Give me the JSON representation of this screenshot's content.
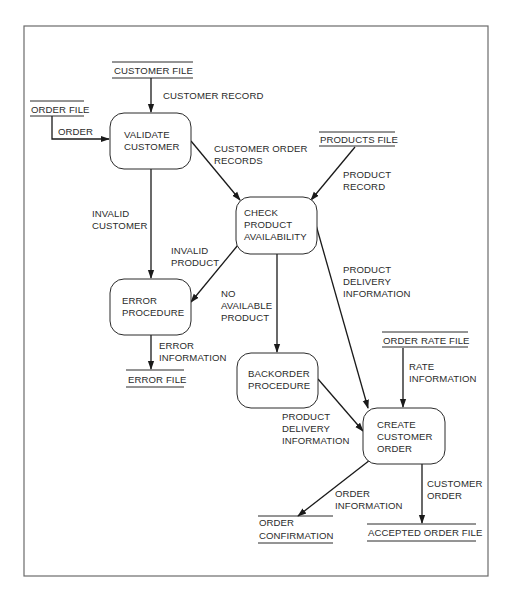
{
  "diagram": {
    "type": "data-flow-diagram",
    "processes": [
      {
        "id": "validate",
        "lines": [
          "VALIDATE",
          "CUSTOMER"
        ]
      },
      {
        "id": "check",
        "lines": [
          "CHECK",
          "PRODUCT",
          "AVAILABILITY"
        ]
      },
      {
        "id": "error",
        "lines": [
          "ERROR",
          "PROCEDURE"
        ]
      },
      {
        "id": "backorder",
        "lines": [
          "BACKORDER",
          "PROCEDURE"
        ]
      },
      {
        "id": "create",
        "lines": [
          "CREATE",
          "CUSTOMER",
          "ORDER"
        ]
      }
    ],
    "stores": [
      {
        "id": "customer_file",
        "lines": [
          "CUSTOMER FILE"
        ]
      },
      {
        "id": "order_file",
        "lines": [
          "ORDER FILE"
        ]
      },
      {
        "id": "products_file",
        "lines": [
          "PRODUCTS FILE"
        ]
      },
      {
        "id": "error_file",
        "lines": [
          "ERROR FILE"
        ]
      },
      {
        "id": "order_rate_file",
        "lines": [
          "ORDER RATE FILE"
        ]
      },
      {
        "id": "order_confirmation",
        "lines": [
          "ORDER",
          "CONFIRMATION"
        ]
      },
      {
        "id": "accepted_order_file",
        "lines": [
          "ACCEPTED ORDER FILE"
        ]
      }
    ],
    "flows": [
      {
        "id": "customer_record",
        "from": "customer_file",
        "to": "validate",
        "lines": [
          "CUSTOMER RECORD"
        ]
      },
      {
        "id": "order",
        "from": "order_file",
        "to": "validate",
        "lines": [
          "ORDER"
        ]
      },
      {
        "id": "customer_order_records",
        "from": "validate",
        "to": "check",
        "lines": [
          "CUSTOMER ORDER",
          "RECORDS"
        ]
      },
      {
        "id": "product_record",
        "from": "products_file",
        "to": "check",
        "lines": [
          "PRODUCT",
          "RECORD"
        ]
      },
      {
        "id": "invalid_customer",
        "from": "validate",
        "to": "error",
        "lines": [
          "INVALID",
          "CUSTOMER"
        ]
      },
      {
        "id": "invalid_product",
        "from": "check",
        "to": "error",
        "lines": [
          "INVALID",
          "PRODUCT"
        ]
      },
      {
        "id": "no_available_product",
        "from": "check",
        "to": "backorder",
        "lines": [
          "NO",
          "AVAILABLE",
          "PRODUCT"
        ]
      },
      {
        "id": "product_delivery_info_1",
        "from": "check",
        "to": "create",
        "lines": [
          "PRODUCT",
          "DELIVERY",
          "INFORMATION"
        ]
      },
      {
        "id": "error_information",
        "from": "error",
        "to": "error_file",
        "lines": [
          "ERROR",
          "INFORMATION"
        ]
      },
      {
        "id": "rate_information",
        "from": "order_rate_file",
        "to": "create",
        "lines": [
          "RATE",
          "INFORMATION"
        ]
      },
      {
        "id": "product_delivery_info_2",
        "from": "backorder",
        "to": "create",
        "lines": [
          "PRODUCT",
          "DELIVERY",
          "INFORMATION"
        ]
      },
      {
        "id": "order_information",
        "from": "create",
        "to": "order_confirmation",
        "lines": [
          "ORDER",
          "INFORMATION"
        ]
      },
      {
        "id": "customer_order",
        "from": "create",
        "to": "accepted_order_file",
        "lines": [
          "CUSTOMER",
          "ORDER"
        ]
      }
    ]
  },
  "labels": {
    "p_validate_1": "VALIDATE",
    "p_validate_2": "CUSTOMER",
    "p_check_1": "CHECK",
    "p_check_2": "PRODUCT",
    "p_check_3": "AVAILABILITY",
    "p_error_1": "ERROR",
    "p_error_2": "PROCEDURE",
    "p_backorder_1": "BACKORDER",
    "p_backorder_2": "PROCEDURE",
    "p_create_1": "CREATE",
    "p_create_2": "CUSTOMER",
    "p_create_3": "ORDER",
    "s_customer_file": "CUSTOMER FILE",
    "s_order_file": "ORDER FILE",
    "s_products_file": "PRODUCTS FILE",
    "s_error_file": "ERROR FILE",
    "s_order_rate_file": "ORDER RATE FILE",
    "s_order_conf_1": "ORDER",
    "s_order_conf_2": "CONFIRMATION",
    "s_accepted_order_file": "ACCEPTED ORDER FILE",
    "f_customer_record": "CUSTOMER RECORD",
    "f_order": "ORDER",
    "f_cor_1": "CUSTOMER ORDER",
    "f_cor_2": "RECORDS",
    "f_pr_1": "PRODUCT",
    "f_pr_2": "RECORD",
    "f_ic_1": "INVALID",
    "f_ic_2": "CUSTOMER",
    "f_ip_1": "INVALID",
    "f_ip_2": "PRODUCT",
    "f_nap_1": "NO",
    "f_nap_2": "AVAILABLE",
    "f_nap_3": "PRODUCT",
    "f_pdi1_1": "PRODUCT",
    "f_pdi1_2": "DELIVERY",
    "f_pdi1_3": "INFORMATION",
    "f_ei_1": "ERROR",
    "f_ei_2": "INFORMATION",
    "f_ri_1": "RATE",
    "f_ri_2": "INFORMATION",
    "f_pdi2_1": "PRODUCT",
    "f_pdi2_2": "DELIVERY",
    "f_pdi2_3": "INFORMATION",
    "f_oi_1": "ORDER",
    "f_oi_2": "INFORMATION",
    "f_co_1": "CUSTOMER",
    "f_co_2": "ORDER"
  }
}
